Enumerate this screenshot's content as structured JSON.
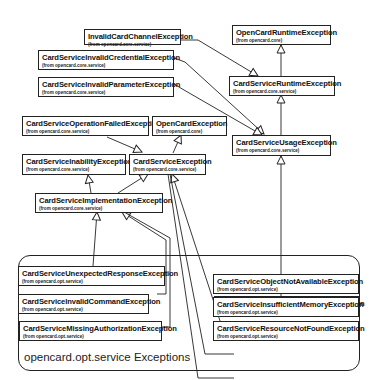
{
  "diagram": {
    "type": "uml-class-hierarchy",
    "package": {
      "label": "opencard.opt.service Exceptions"
    },
    "classes": [
      {
        "id": "InvalidCardChannelException",
        "name": "InvalidCardChannelException",
        "from": "(from opencard.core.service)"
      },
      {
        "id": "OpenCardRuntimeException",
        "name": "OpenCardRuntimeException",
        "from": "(from opencard.core)"
      },
      {
        "id": "CardServiceInvalidCredentialException",
        "name": "CardServiceInvalidCredentialException",
        "from": "(from opencard.core.service)"
      },
      {
        "id": "CardServiceRuntimeException",
        "name": "CardServiceRuntimeException",
        "from": "(from opencard.core.service)"
      },
      {
        "id": "CardServiceInvalidParameterException",
        "name": "CardServiceInvalidParameterException",
        "from": "(from opencard.core.service)"
      },
      {
        "id": "CardServiceOperationFailedException",
        "name": "CardServiceOperationFailedException",
        "from": "(from opencard.core.service)"
      },
      {
        "id": "OpenCardException",
        "name": "OpenCardException",
        "from": "(from opencard.core)"
      },
      {
        "id": "CardServiceUsageException",
        "name": "CardServiceUsageException",
        "from": "(from opencard.core.service)"
      },
      {
        "id": "CardServiceInabilityException",
        "name": "CardServiceInabilityException",
        "from": "(from opencard.core.service)"
      },
      {
        "id": "CardServiceException",
        "name": "CardServiceException",
        "from": "(from opencard.core.service)"
      },
      {
        "id": "CardServiceImplementationException",
        "name": "CardServiceImplementationException",
        "from": "(from opencard.core.service)"
      },
      {
        "id": "CardServiceMissingCredentialsException",
        "name": "CardServiceMissingCredentialsException",
        "from": "(from opencard.opt.service)"
      },
      {
        "id": "CardServiceUnexpectedResponseException",
        "name": "CardServiceUnexpectedResponseException",
        "from": "(from opencard.opt.service)"
      },
      {
        "id": "CardServiceObjectNotAvailableException",
        "name": "CardServiceObjectNotAvailableException",
        "from": "(from opencard.opt.service)"
      },
      {
        "id": "CardServiceInvalidCommandException",
        "name": "CardServiceInvalidCommandException",
        "from": "(from opencard.opt.service)"
      },
      {
        "id": "CardServiceInsufficientMemoryException",
        "name": "CardServiceInsufficientMemoryException",
        "from": "(from opencard.opt.service)"
      },
      {
        "id": "CardServiceMissingAuthorizationException",
        "name": "CardServiceMissingAuthorizationException",
        "from": "(from opencard.opt.service)"
      },
      {
        "id": "CardServiceResourceNotFoundException",
        "name": "CardServiceResourceNotFoundException",
        "from": "(from opencard.opt.service)"
      }
    ],
    "generalizations": [
      {
        "from": "CardServiceRuntimeException",
        "to": "OpenCardRuntimeException"
      },
      {
        "from": "InvalidCardChannelException",
        "to": "CardServiceRuntimeException"
      },
      {
        "from": "CardServiceUsageException",
        "to": "CardServiceRuntimeException"
      },
      {
        "from": "CardServiceInvalidCredentialException",
        "to": "CardServiceUsageException"
      },
      {
        "from": "CardServiceInvalidParameterException",
        "to": "CardServiceUsageException"
      },
      {
        "from": "CardServiceMissingCredentialsException",
        "to": "CardServiceUsageException"
      },
      {
        "from": "CardServiceException",
        "to": "OpenCardException"
      },
      {
        "from": "CardServiceOperationFailedException",
        "to": "CardServiceException"
      },
      {
        "from": "CardServiceImplementationException",
        "to": "CardServiceException"
      },
      {
        "from": "CardServiceImplementationException",
        "to": "CardServiceInabilityException"
      },
      {
        "from": "CardServiceObjectNotAvailableException",
        "to": "CardServiceException"
      },
      {
        "from": "CardServiceInsufficientMemoryException",
        "to": "CardServiceException"
      },
      {
        "from": "CardServiceResourceNotFoundException",
        "to": "CardServiceException"
      },
      {
        "from": "CardServiceUnexpectedResponseException",
        "to": "CardServiceImplementationException"
      },
      {
        "from": "CardServiceInvalidCommandException",
        "to": "CardServiceImplementationException"
      },
      {
        "from": "CardServiceMissingAuthorizationException",
        "to": "CardServiceImplementationException"
      }
    ]
  }
}
